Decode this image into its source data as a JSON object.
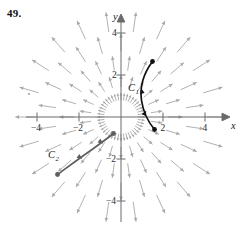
{
  "figure": {
    "problem_number": "49.",
    "axes": {
      "x_label": "x",
      "y_label": "y",
      "x_ticks": [
        {
          "value": -4,
          "label": "−4"
        },
        {
          "value": -2,
          "label": "−2"
        },
        {
          "value": 2,
          "label": "2"
        },
        {
          "value": 4,
          "label": "4"
        }
      ],
      "y_ticks": [
        {
          "value": 4,
          "label": "4"
        },
        {
          "value": 2,
          "label": "2"
        },
        {
          "value": -2,
          "label": "−2"
        },
        {
          "value": -4,
          "label": "−4"
        }
      ],
      "x_range": [
        -5.0,
        5.2
      ],
      "y_range": [
        -5.0,
        5.2
      ],
      "axis_color": "#6a6a6a"
    },
    "curves": [
      {
        "name": "C1",
        "label": "C",
        "subscript": "1",
        "color": "#111111",
        "label_x": 128,
        "label_y": 91,
        "path": "M 152.5 61.5 C 143.5 73.5 139.5 86.5 141.5 100.5 C 143.5 113.5 149.5 123.5 154.5 129.5",
        "start_point": {
          "x": 152.5,
          "y": 61.5
        },
        "end_point": {
          "x": 154.5,
          "y": 129.5
        },
        "direction_arrows": [
          {
            "x": 141.8,
            "y": 91.0,
            "angle": 100
          },
          {
            "x": 145.0,
            "y": 113.0,
            "angle": 62
          }
        ]
      },
      {
        "name": "C2",
        "label": "C",
        "subscript": "2",
        "color": "#5d5d5d",
        "label_x": 48,
        "label_y": 158,
        "path": "M 57.5 174.5 C 68.5 166.5 80.5 157.5 93.5 148.5 C 101.5 142.5 108.5 137.5 113.5 133.5",
        "start_point": {
          "x": 57.5,
          "y": 174.5
        },
        "end_point": {
          "x": 113.5,
          "y": 133.5
        },
        "direction_arrows": [
          {
            "x": 80.0,
            "y": 157.5,
            "angle": -38
          },
          {
            "x": 101.0,
            "y": 142.0,
            "angle": -36
          }
        ]
      }
    ],
    "vector_field": {
      "description": "radial-outward-arrows",
      "arrow_color": "#a8a8a8",
      "origin_px": {
        "x": 121,
        "y": 117
      },
      "pixels_per_unit": 21,
      "rings": [
        {
          "radius": 0.82,
          "count": 44,
          "length": 0.3
        },
        {
          "radius": 1.45,
          "count": 22,
          "length": 0.52
        },
        {
          "radius": 2.25,
          "count": 22,
          "length": 0.66
        },
        {
          "radius": 3.15,
          "count": 22,
          "length": 0.8
        },
        {
          "radius": 4.1,
          "count": 22,
          "length": 0.92
        }
      ]
    }
  }
}
